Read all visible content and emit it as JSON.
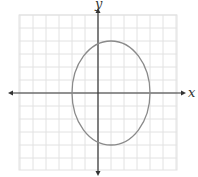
{
  "chart_data": {
    "type": "line",
    "title": "",
    "xlabel": "x",
    "ylabel": "y",
    "grid": true,
    "axis_arrows": true,
    "xlim": [
      -6,
      6
    ],
    "ylim": [
      -6,
      6
    ],
    "grid_step": 1,
    "curve": {
      "kind": "ellipse",
      "equation": "(x-1)^2/9 + y^2/16 = 1",
      "center": [
        1,
        0
      ],
      "semi_axis_x": 3,
      "semi_axis_y": 4,
      "vertices": [
        [
          1,
          4
        ],
        [
          1,
          -4
        ],
        [
          -2,
          0
        ],
        [
          4,
          0
        ]
      ]
    }
  },
  "colors": {
    "grid": "#e2e2e2",
    "axis": "#333333",
    "curve": "#8a8a8a",
    "background": "#ffffff"
  },
  "layout": {
    "origin_px": [
      98,
      93
    ],
    "unit_px": 13,
    "grid_left": 19,
    "grid_top": 15,
    "grid_right": 177,
    "grid_bottom": 170
  }
}
